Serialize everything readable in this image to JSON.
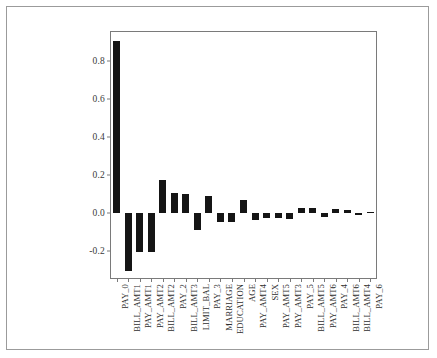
{
  "chart_data": {
    "type": "bar",
    "title": "",
    "subtitle": "",
    "xlabel": "",
    "ylabel": "",
    "grid": false,
    "legend": null,
    "orientation": "vertical",
    "bar_color": "#151515",
    "xtick_rotation": -90,
    "ylim": [
      -0.34,
      0.95
    ],
    "yticks": [
      "-0.2",
      "0.0",
      "0.2",
      "0.4",
      "0.6",
      "0.8"
    ],
    "ytick_values": [
      -0.2,
      0.0,
      0.2,
      0.4,
      0.6,
      0.8
    ],
    "categories": [
      "PAY_0",
      "BILL_AMT1",
      "PAY_AMT1",
      "PAY_AMT2",
      "BILL_AMT2",
      "PAY_2",
      "BILL_AMT3",
      "LIMIT_BAL",
      "PAY_3",
      "MARRIAGE",
      "EDUCATION",
      "AGE",
      "PAY_AMT4",
      "SEX",
      "PAY_AMT5",
      "PAY_AMT3",
      "PAY_5",
      "BILL_AMT5",
      "PAY_AMT6",
      "PAY_4",
      "BILL_AMT6",
      "BILL_AMT4",
      "PAY_6"
    ],
    "values": [
      0.905,
      -0.305,
      -0.205,
      -0.203,
      0.175,
      0.105,
      0.098,
      -0.086,
      0.092,
      -0.048,
      -0.047,
      0.07,
      -0.037,
      -0.026,
      -0.026,
      -0.03,
      0.028,
      0.028,
      -0.022,
      0.022,
      0.019,
      -0.005,
      0.008
    ]
  }
}
